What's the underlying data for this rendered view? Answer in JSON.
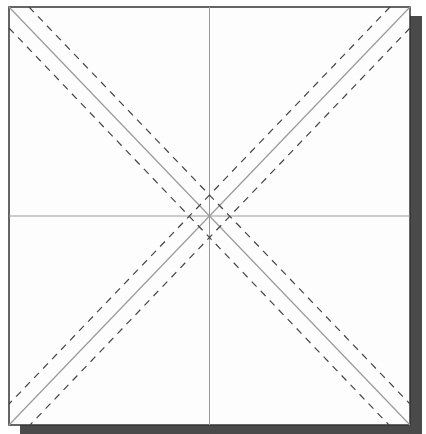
{
  "diagram": {
    "type": "origami-crease-pattern",
    "paper": {
      "x": 9,
      "y": 7,
      "width": 401,
      "height": 418,
      "fill": "#fdfdfd",
      "stroke": "#333333"
    },
    "shadow": {
      "offset_x": 11,
      "offset_y": 9,
      "fill": "#4a4a4a"
    },
    "colors": {
      "crease": "#9a9a9a",
      "dashed": "#444444"
    },
    "lines": {
      "center_creases": [
        "vertical",
        "horizontal"
      ],
      "diagonals": [
        "top-left to bottom-right",
        "top-right to bottom-left"
      ],
      "dashed_offsets_px": 14
    }
  }
}
